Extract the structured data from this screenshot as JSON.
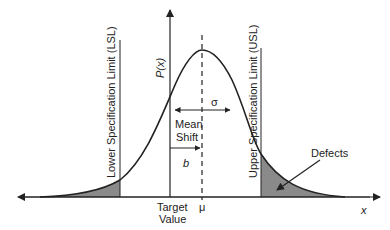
{
  "diagram": {
    "y_axis_label": "P(x)",
    "x_axis_label": "x",
    "lsl_label": "Lower Specification Limit  (LSL)",
    "usl_label": "Upper  Specification Limit  (USL)",
    "sigma_label": "σ",
    "mean_shift_line1": "Mean",
    "mean_shift_line2": "Shift",
    "b_label": "b",
    "target_line1": "Target",
    "target_line2": "Value",
    "mu_label": "μ",
    "defects_label": "Defects",
    "colors": {
      "line": "#222222",
      "shade": "#8a8a8a"
    }
  }
}
